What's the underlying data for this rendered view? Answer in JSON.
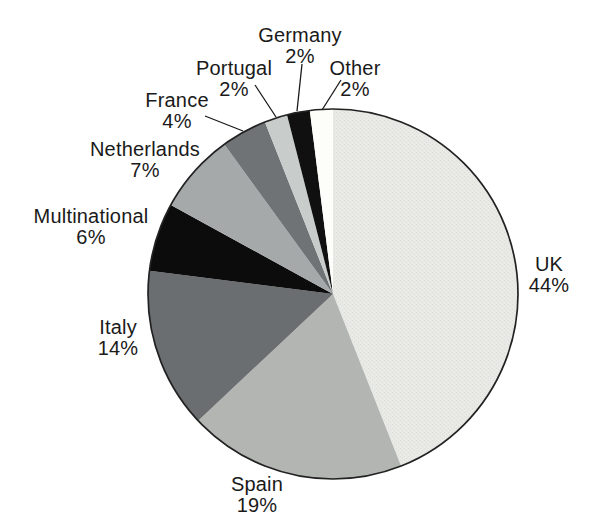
{
  "figure": {
    "background": "#ffffff",
    "outline_color": "#222222",
    "leader_line_color": "#1a1a1a",
    "label_color": "#1a1a1a"
  },
  "chart_data": {
    "type": "pie",
    "title": "",
    "unit": "%",
    "direction": "clockwise",
    "start_angle_deg": 0,
    "legend": "none",
    "labels": "outside-with-percent",
    "categories": [
      "UK",
      "Spain",
      "Italy",
      "Multinational",
      "Netherlands",
      "France",
      "Portugal",
      "Germany",
      "Other"
    ],
    "values": [
      44,
      19,
      14,
      6,
      7,
      4,
      2,
      2,
      2
    ],
    "slices": [
      {
        "label": "UK",
        "value": 44,
        "pct_label": "44%",
        "color": "#e9eae6",
        "textured": true,
        "texture_dot": "#dcdfd9",
        "label_px": {
          "x": 549,
          "y": 275
        }
      },
      {
        "label": "Spain",
        "value": 19,
        "pct_label": "19%",
        "color": "#b2b5b2",
        "label_px": {
          "x": 257,
          "y": 495
        }
      },
      {
        "label": "Italy",
        "value": 14,
        "pct_label": "14%",
        "color": "#6b6e70",
        "label_px": {
          "x": 118,
          "y": 338
        }
      },
      {
        "label": "Multinational",
        "value": 6,
        "pct_label": "6%",
        "color": "#0c0c0c",
        "label_px": {
          "x": 91,
          "y": 227
        }
      },
      {
        "label": "Netherlands",
        "value": 7,
        "pct_label": "7%",
        "color": "#a5a9aa",
        "label_px": {
          "x": 145,
          "y": 160
        }
      },
      {
        "label": "France",
        "value": 4,
        "pct_label": "4%",
        "color": "#707375",
        "label_px": {
          "x": 177,
          "y": 111
        },
        "leader_px": [
          205,
          116,
          243,
          131
        ]
      },
      {
        "label": "Portugal",
        "value": 2,
        "pct_label": "2%",
        "color": "#c8cccb",
        "label_px": {
          "x": 234,
          "y": 79
        },
        "leader_px": [
          255,
          85,
          276,
          117
        ]
      },
      {
        "label": "Germany",
        "value": 2,
        "pct_label": "2%",
        "color": "#101010",
        "label_px": {
          "x": 300,
          "y": 46
        },
        "leader_px": [
          302,
          64,
          297,
          111
        ]
      },
      {
        "label": "Other",
        "value": 2,
        "pct_label": "2%",
        "color": "#fdfdfa",
        "label_px": {
          "x": 355,
          "y": 79
        },
        "leader_px": [
          341,
          80,
          322,
          110
        ]
      }
    ],
    "geometry_px": {
      "cx": 333,
      "cy": 294,
      "r": 185
    }
  }
}
